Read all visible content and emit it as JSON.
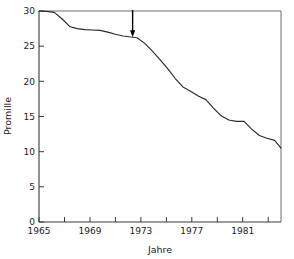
{
  "chart_data": {
    "type": "line",
    "title": "",
    "subtitle": "",
    "xlabel": "Jahre",
    "ylabel": "Promille",
    "xlim": [
      1965,
      1984
    ],
    "ylim": [
      0,
      30
    ],
    "grid": false,
    "legend": null,
    "x_ticks_major": [
      1965,
      1969,
      1973,
      1977,
      1981
    ],
    "x_ticklabels": [
      "1965",
      "1969",
      "1973",
      "1977",
      "1981"
    ],
    "x_ticks_minor": [
      1967,
      1971,
      1975,
      1979,
      1983
    ],
    "y_ticks": [
      0,
      5,
      10,
      15,
      20,
      25,
      30
    ],
    "y_ticklabels": [
      "0",
      "5",
      "10",
      "15",
      "20",
      "25",
      "30"
    ],
    "series": [
      {
        "name": "Promille",
        "color": "#2a2a2a",
        "x": [
          1965.0,
          1965.6,
          1966.2,
          1966.8,
          1967.4,
          1968.0,
          1968.6,
          1969.2,
          1969.8,
          1970.4,
          1971.0,
          1971.6,
          1972.2,
          1972.7,
          1973.3,
          1973.9,
          1974.5,
          1975.1,
          1975.7,
          1976.3,
          1976.9,
          1977.5,
          1978.1,
          1978.7,
          1979.3,
          1979.9,
          1980.5,
          1981.1,
          1981.7,
          1982.3,
          1982.9,
          1983.5,
          1984.0
        ],
        "y": [
          30.0,
          29.95,
          29.8,
          28.9,
          27.8,
          27.5,
          27.35,
          27.3,
          27.25,
          27.0,
          26.7,
          26.45,
          26.3,
          26.2,
          25.4,
          24.3,
          23.1,
          21.8,
          20.4,
          19.2,
          18.6,
          17.9,
          17.4,
          16.2,
          15.1,
          14.5,
          14.3,
          14.3,
          13.2,
          12.3,
          11.9,
          11.6,
          10.5
        ]
      }
    ],
    "annotations": [
      {
        "type": "arrow",
        "name": "down-arrow-marker",
        "x": 1972.35,
        "y_start": 30.0,
        "y_end": 26.35,
        "direction": "down",
        "color": "#000000",
        "label": ""
      }
    ]
  },
  "axes": {
    "y_title": "Promille",
    "x_title": "Jahre"
  }
}
